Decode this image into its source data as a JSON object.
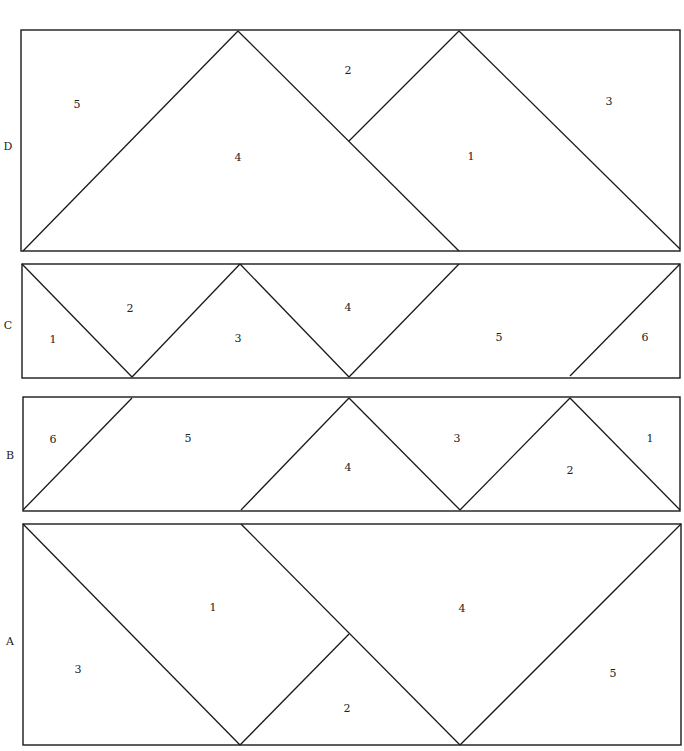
{
  "diagram": {
    "type": "quilt-block-piecing-diagram",
    "line_color": "#1a1a1a",
    "background": "#ffffff",
    "rows": [
      {
        "label": "D",
        "label_pos": [
          8,
          146
        ],
        "rect": [
          21,
          30,
          659,
          221
        ],
        "lines": [
          [
            23,
            251,
            238,
            31
          ],
          [
            238,
            31,
            459,
            251
          ],
          [
            349,
            141,
            459,
            31
          ],
          [
            459,
            31,
            680,
            249
          ]
        ],
        "pieces": [
          {
            "label": "5",
            "pos": [
              77,
              104
            ]
          },
          {
            "label": "2",
            "pos": [
              348,
              70
            ]
          },
          {
            "label": "3",
            "pos": [
              609,
              101
            ]
          },
          {
            "label": "4",
            "pos": [
              238,
              157
            ]
          },
          {
            "label": "1",
            "pos": [
              471,
              156
            ]
          }
        ]
      },
      {
        "label": "C",
        "label_pos": [
          8,
          325
        ],
        "rect": [
          22,
          264,
          658,
          114
        ],
        "lines": [
          [
            22,
            264,
            132,
            377
          ],
          [
            132,
            377,
            240,
            264
          ],
          [
            240,
            264,
            349,
            377
          ],
          [
            349,
            377,
            459,
            264
          ],
          [
            570,
            376,
            680,
            264
          ]
        ],
        "pieces": [
          {
            "label": "1",
            "pos": [
              53,
              339
            ]
          },
          {
            "label": "2",
            "pos": [
              130,
              308
            ]
          },
          {
            "label": "3",
            "pos": [
              238,
              338
            ]
          },
          {
            "label": "4",
            "pos": [
              348,
              307
            ]
          },
          {
            "label": "5",
            "pos": [
              499,
              337
            ]
          },
          {
            "label": "6",
            "pos": [
              645,
              337
            ]
          }
        ]
      },
      {
        "label": "B",
        "label_pos": [
          10,
          455
        ],
        "rect": [
          23,
          397,
          657,
          114
        ],
        "lines": [
          [
            23,
            510,
            132,
            398
          ],
          [
            241,
            510,
            349,
            398
          ],
          [
            349,
            398,
            460,
            510
          ],
          [
            460,
            510,
            570,
            398
          ],
          [
            570,
            398,
            680,
            510
          ]
        ],
        "pieces": [
          {
            "label": "6",
            "pos": [
              53,
              439
            ]
          },
          {
            "label": "5",
            "pos": [
              188,
              438
            ]
          },
          {
            "label": "4",
            "pos": [
              348,
              467
            ]
          },
          {
            "label": "3",
            "pos": [
              457,
              438
            ]
          },
          {
            "label": "2",
            "pos": [
              570,
              470
            ]
          },
          {
            "label": "1",
            "pos": [
              650,
              438
            ]
          }
        ]
      },
      {
        "label": "A",
        "label_pos": [
          10,
          641
        ],
        "rect": [
          23,
          524,
          658,
          221
        ],
        "lines": [
          [
            23,
            524,
            240,
            745
          ],
          [
            240,
            745,
            349,
            634
          ],
          [
            241,
            524,
            460,
            745
          ],
          [
            460,
            745,
            681,
            524
          ]
        ],
        "pieces": [
          {
            "label": "1",
            "pos": [
              213,
              607
            ]
          },
          {
            "label": "4",
            "pos": [
              462,
              608
            ]
          },
          {
            "label": "3",
            "pos": [
              78,
              669
            ]
          },
          {
            "label": "5",
            "pos": [
              613,
              673
            ]
          },
          {
            "label": "2",
            "pos": [
              347,
              708
            ]
          }
        ]
      }
    ]
  }
}
